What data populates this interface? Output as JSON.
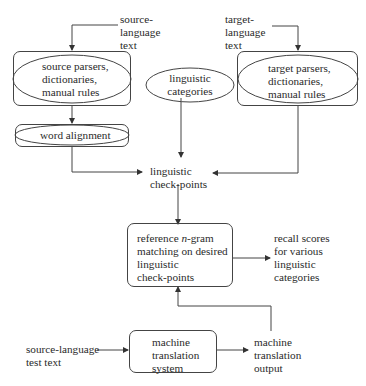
{
  "diagram": {
    "inputs": {
      "source_language_text": "source-\nlanguage\ntext",
      "target_language_text": "target-\nlanguage\ntext",
      "source_language_test_text": "source-language\ntest text"
    },
    "nodes": {
      "source_parsers": "source parsers,\ndictionaries,\nmanual rules",
      "linguistic_categories": "linguistic\ncategories",
      "target_parsers": "target parsers,\ndictionaries,\nmanual rules",
      "word_alignment": "word alignment",
      "linguistic_checkpoints": "linguistic\ncheck-points",
      "reference_matching_prefix": "reference ",
      "reference_matching_italic": "n",
      "reference_matching_suffix": "-gram\nmatching on desired\nlinguistic\ncheck-points",
      "mt_system": "machine\ntranslation\nsystem"
    },
    "outputs": {
      "recall_scores": "recall scores\nfor various\nlinguistic\ncategories",
      "mt_output": "machine\ntranslation\noutput"
    }
  }
}
